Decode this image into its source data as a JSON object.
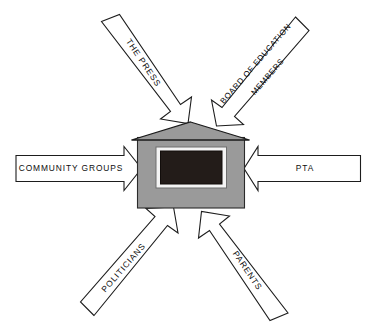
{
  "diagram": {
    "center": {
      "name": "school-building",
      "label": "",
      "fill_color": "#9a9a9a",
      "roof_color": "#9a9a9a",
      "board_color": "#231c19",
      "board_frame_color": "#f4f4f4"
    },
    "background_color": "#ffffff",
    "outline_color": "#1d1d1d",
    "arrow_fill_color": "#ffffff",
    "arrows": [
      {
        "id": "the-press",
        "label": "THE PRESS",
        "label_lines": [
          "THE PRESS"
        ],
        "direction": "down-right",
        "position": "top-left",
        "points_to": "school-building"
      },
      {
        "id": "board-of-education-members",
        "label": "BOARD OF EDUCATION MEMBERS",
        "label_lines": [
          "BOARD OF EDUCATION",
          "MEMBERS"
        ],
        "direction": "down-left",
        "position": "top-right",
        "points_to": "school-building"
      },
      {
        "id": "community-groups",
        "label": "COMMUNITY GROUPS",
        "label_lines": [
          "COMMUNITY GROUPS"
        ],
        "direction": "right",
        "position": "left",
        "points_to": "school-building"
      },
      {
        "id": "pta",
        "label": "PTA",
        "label_lines": [
          "PTA"
        ],
        "direction": "left",
        "position": "right",
        "points_to": "school-building"
      },
      {
        "id": "politicians",
        "label": "POLITICIANS",
        "label_lines": [
          "POLITICIANS"
        ],
        "direction": "up-right",
        "position": "bottom-left",
        "points_to": "school-building"
      },
      {
        "id": "parents",
        "label": "PARENTS",
        "label_lines": [
          "PARENTS"
        ],
        "direction": "up-left",
        "position": "bottom-right",
        "points_to": "school-building"
      }
    ]
  }
}
